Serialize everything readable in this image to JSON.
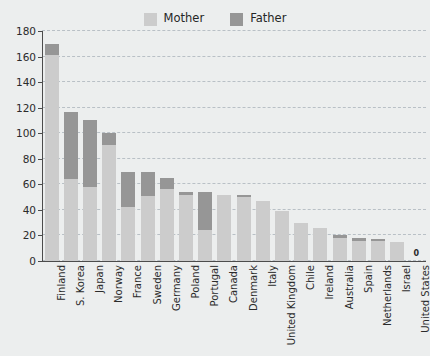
{
  "chart_data": {
    "type": "bar",
    "subtype": "stacked-bar",
    "title": "",
    "xlabel": "",
    "ylabel": "Weeks of paid leave",
    "ylim": [
      0,
      180
    ],
    "yticks": [
      0,
      20,
      40,
      60,
      80,
      100,
      120,
      140,
      160,
      180
    ],
    "grid": true,
    "grid_style": "dashed-horizontal",
    "legend": {
      "position": "top-center",
      "entries": [
        {
          "name": "Mother",
          "color": "#cccccc"
        },
        {
          "name": "Father",
          "color": "#969696"
        }
      ]
    },
    "categories": [
      "Finland",
      "S. Korea",
      "Japan",
      "Norway",
      "France",
      "Sweden",
      "Germany",
      "Poland",
      "Portugal",
      "Canada",
      "Denmark",
      "Italy",
      "United Kingdom",
      "Chile",
      "Ireland",
      "Australia",
      "Spain",
      "Netherlands",
      "Israel",
      "United States"
    ],
    "series": [
      {
        "name": "Mother",
        "color": "#cccccc",
        "values": [
          161,
          64,
          58,
          91,
          42,
          51,
          56,
          52,
          24,
          52,
          50,
          47,
          39,
          30,
          26,
          18,
          16,
          16,
          15,
          0
        ]
      },
      {
        "name": "Father",
        "color": "#969696",
        "values": [
          9,
          53,
          52,
          9,
          28,
          19,
          9,
          2,
          30,
          0,
          2,
          0,
          0,
          0,
          0,
          2,
          2,
          1,
          0,
          0
        ]
      }
    ],
    "totals": [
      170,
      117,
      110,
      100,
      70,
      70,
      65,
      54,
      54,
      52,
      52,
      47,
      39,
      30,
      26,
      20,
      18,
      17,
      15,
      0
    ],
    "annotations": [
      {
        "category": "United States",
        "text": "0"
      }
    ]
  },
  "figure": {
    "background_color": "#eceeee",
    "axis_color": "#4c4c4c",
    "grid_color": "#b9c0c6",
    "text_color": "#2b2b2b"
  }
}
